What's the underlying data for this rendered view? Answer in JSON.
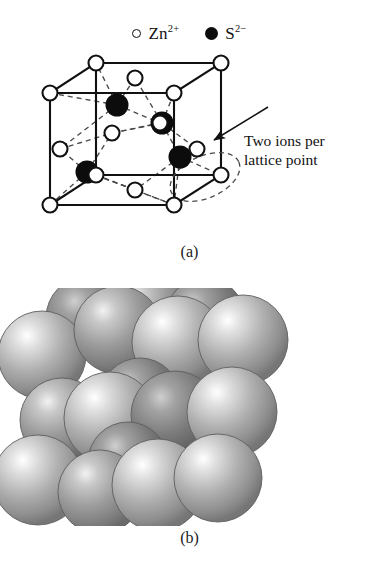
{
  "figure": {
    "background_color": "#ffffff",
    "ink_color": "#111111"
  },
  "legend": {
    "entries": [
      {
        "icon": "open-circle-icon",
        "symbol": "Zn",
        "charge": "2+",
        "label": "Zn2+",
        "marker": "open",
        "color": "#ffffff",
        "stroke": "#111111"
      },
      {
        "icon": "filled-circle-icon",
        "symbol": "S",
        "charge": "2−",
        "label": "S2−",
        "marker": "filled",
        "color": "#0c0c0c",
        "stroke": "#0c0c0c"
      }
    ]
  },
  "panel_a": {
    "caption": "(a)",
    "type": "unit-cell-wireframe",
    "annotation": {
      "line1": "Two ions per",
      "line2": "lattice point",
      "arrow": {
        "from_x": 268,
        "from_y": 107,
        "to_x": 211,
        "to_y": 140
      },
      "highlight_ellipse": {
        "cx": 205,
        "cy": 177,
        "rx": 36,
        "ry": 21,
        "rotation": -22,
        "style": "dashed"
      }
    },
    "cube": {
      "stroke": "#111111",
      "stroke_width": 2.1,
      "front_top_left": [
        50,
        93
      ],
      "front_top_right": [
        174,
        93
      ],
      "front_bottom_left": [
        50,
        205
      ],
      "front_bottom_right": [
        174,
        205
      ],
      "back_top_left": [
        96,
        63
      ],
      "back_top_right": [
        221,
        63
      ],
      "back_bottom_left": [
        96,
        175
      ],
      "back_bottom_right": [
        221,
        175
      ]
    },
    "zinc_ions": {
      "marker": "open-circle",
      "radius": 7.5,
      "stroke_width": 2.1,
      "corner_positions": [
        [
          50,
          93
        ],
        [
          174,
          93
        ],
        [
          50,
          205
        ],
        [
          174,
          205
        ],
        [
          96,
          63
        ],
        [
          221,
          63
        ],
        [
          96,
          175
        ],
        [
          221,
          175
        ]
      ],
      "face_positions": [
        [
          135,
          78
        ],
        [
          73,
          149
        ],
        [
          197,
          149
        ],
        [
          112,
          133
        ],
        [
          135,
          190
        ],
        [
          159,
          120
        ]
      ]
    },
    "sulfur_ions": {
      "marker": "filled-circle",
      "radius": 11,
      "positions": [
        [
          117,
          105
        ],
        [
          162,
          123
        ],
        [
          87,
          172
        ],
        [
          180,
          157
        ]
      ]
    },
    "bonds": {
      "style": "dashed",
      "stroke": "#4a4a4a",
      "dash_pattern": "5,4"
    }
  },
  "panel_b": {
    "caption": "(b)",
    "type": "hard-sphere-packing-model",
    "sphere_fill_light": "#e8e8e8",
    "sphere_fill_mid": "#a8a8a8",
    "sphere_fill_dark": "#6e6e6e",
    "sphere_outline": "#5a5a5a",
    "spheres": [
      {
        "cx": 42,
        "cy": 355,
        "r": 44,
        "shade": "light"
      },
      {
        "cx": 118,
        "cy": 330,
        "r": 44,
        "shade": "mid"
      },
      {
        "cx": 178,
        "cy": 342,
        "r": 46,
        "shade": "light"
      },
      {
        "cx": 243,
        "cy": 340,
        "r": 45,
        "shade": "light"
      },
      {
        "cx": 88,
        "cy": 318,
        "r": 42,
        "shade": "dark"
      },
      {
        "cx": 148,
        "cy": 312,
        "r": 40,
        "shade": "mid"
      },
      {
        "cx": 205,
        "cy": 318,
        "r": 40,
        "shade": "dark"
      },
      {
        "cx": 62,
        "cy": 420,
        "r": 42,
        "shade": "mid"
      },
      {
        "cx": 110,
        "cy": 418,
        "r": 46,
        "shade": "light"
      },
      {
        "cx": 175,
        "cy": 415,
        "r": 44,
        "shade": "dark"
      },
      {
        "cx": 232,
        "cy": 412,
        "r": 45,
        "shade": "light"
      },
      {
        "cx": 140,
        "cy": 398,
        "r": 40,
        "shade": "dark"
      },
      {
        "cx": 38,
        "cy": 480,
        "r": 45,
        "shade": "light"
      },
      {
        "cx": 100,
        "cy": 492,
        "r": 42,
        "shade": "mid"
      },
      {
        "cx": 158,
        "cy": 485,
        "r": 46,
        "shade": "light"
      },
      {
        "cx": 218,
        "cy": 478,
        "r": 44,
        "shade": "light"
      },
      {
        "cx": 128,
        "cy": 462,
        "r": 40,
        "shade": "dark"
      }
    ],
    "edge_guides": {
      "style": "dotted",
      "stroke": "#b5b5b5"
    }
  }
}
